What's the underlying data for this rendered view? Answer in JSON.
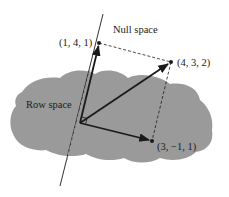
{
  "diagram": {
    "labels": {
      "null_space": "Null space",
      "row_space": "Row space",
      "point_null": "(1, 4, 1)",
      "point_sum": "(4, 3, 2)",
      "point_row": "(3, −1, 1)"
    },
    "colors": {
      "region_fill": "#9a9a9a",
      "ink": "#1a1a1a",
      "background": "#ffffff"
    },
    "vectors": [
      {
        "name": "null-space-vector",
        "components": [
          1,
          4,
          1
        ]
      },
      {
        "name": "sum-vector",
        "components": [
          4,
          3,
          2
        ]
      },
      {
        "name": "row-space-vector",
        "components": [
          3,
          -1,
          1
        ]
      }
    ]
  }
}
